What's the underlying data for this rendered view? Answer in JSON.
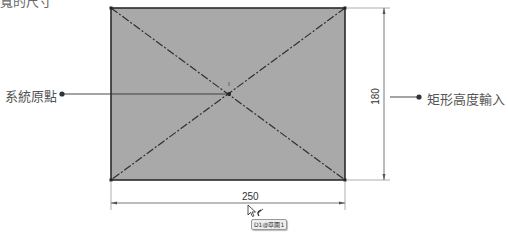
{
  "caption": {
    "partial_text": "寬的尺寸"
  },
  "callouts": {
    "origin_label": "系統原點",
    "height_input_label": "矩形高度輸入"
  },
  "dimensions": {
    "width_value": "250",
    "height_value": "180"
  },
  "tooltip": {
    "text": "D1@草圖1"
  },
  "colors": {
    "rectangle_fill": "#a9a9a9",
    "rectangle_stroke": "#2b2b2b",
    "construction_line": "#2f2f2f",
    "dimension_line": "#555555",
    "callout_line": "#333333"
  }
}
